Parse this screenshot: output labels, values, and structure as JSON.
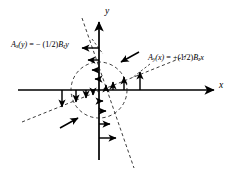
{
  "figure": {
    "kind": "vector-field-diagram",
    "background": "#ffffff",
    "ink": "#000000"
  },
  "axes": {
    "x_label": "x",
    "y_label": "y",
    "origin": {
      "x": 99,
      "y": 90
    },
    "x_axis": {
      "x1": 18,
      "y1": 90,
      "x2": 216,
      "y2": 90
    },
    "y_axis": {
      "x1": 99,
      "y1": 160,
      "x2": 99,
      "y2": 20
    }
  },
  "circle": {
    "cx": 99,
    "cy": 90,
    "r": 28,
    "style": "dashed",
    "circulation": "counterclockwise"
  },
  "dashed_lines": [
    {
      "name": "line-Ay-of-x",
      "x1": 22,
      "y1": 122,
      "x2": 186,
      "y2": 56
    },
    {
      "name": "line-Ax-of-y",
      "x1": 82,
      "y1": 18,
      "x2": 134,
      "y2": 168
    }
  ],
  "labels": {
    "left": {
      "name": "label-Ax-of-y",
      "symbol": "A",
      "symbol_sub": "x",
      "arg": "(y)",
      "equals": "= − (1/2)",
      "field": "B",
      "field_sub": "z",
      "variable": "y",
      "full_text": "Ax(y) = − (1/2)Bz y"
    },
    "right": {
      "name": "label-Ay-of-x",
      "symbol": "A",
      "symbol_sub": "y",
      "arg": "(x)",
      "equals": "= +(1/2)",
      "field": "B",
      "field_sub": "z",
      "variable": "x",
      "full_text": "Ay(x) = +(1/2)Bz x"
    }
  },
  "leader_lines": [
    {
      "name": "leader-left",
      "x1": 92,
      "y1": 39,
      "x2": 104,
      "y2": 56
    },
    {
      "name": "leader-right",
      "x1": 150,
      "y1": 63,
      "x2": 131,
      "y2": 78
    }
  ],
  "field_arrows": {
    "y_axis_above_origin": {
      "direction": "negative-x",
      "items": [
        {
          "y": 48,
          "len": 19
        },
        {
          "y": 60,
          "len": 13
        },
        {
          "y": 70,
          "len": 8
        },
        {
          "y": 79,
          "len": 5
        }
      ]
    },
    "y_axis_below_origin": {
      "direction": "positive-x",
      "items": [
        {
          "y": 101,
          "len": 5
        },
        {
          "y": 111,
          "len": 8
        },
        {
          "y": 124,
          "len": 13
        },
        {
          "y": 138,
          "len": 19
        }
      ]
    },
    "x_axis_left_of_origin": {
      "direction": "negative-y",
      "items": [
        {
          "x": 62,
          "len": 19
        },
        {
          "x": 76,
          "len": 13
        },
        {
          "x": 86,
          "len": 8
        },
        {
          "x": 93,
          "len": 5
        }
      ]
    },
    "x_axis_right_of_origin": {
      "direction": "positive-y",
      "items": [
        {
          "x": 106,
          "len": 5
        },
        {
          "x": 113,
          "len": 8
        },
        {
          "x": 124,
          "len": 13
        },
        {
          "x": 140,
          "len": 19
        }
      ]
    },
    "tangential": [
      {
        "name": "tangent-arrow-upper-right",
        "x1": 138,
        "y1": 52,
        "x2": 121,
        "y2": 62
      },
      {
        "name": "tangent-arrow-lower-left",
        "x1": 61,
        "y1": 128,
        "x2": 78,
        "y2": 118
      }
    ]
  }
}
